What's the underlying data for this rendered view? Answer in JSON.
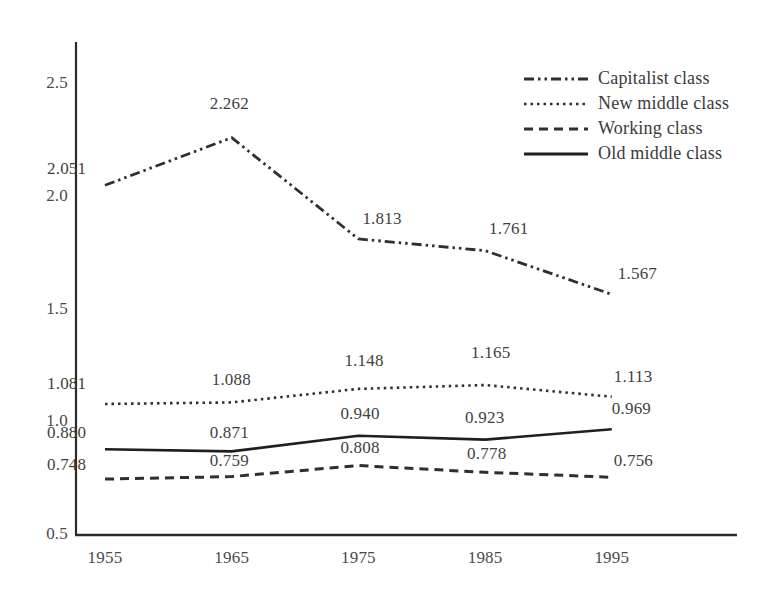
{
  "chart_data": {
    "type": "line",
    "title": "",
    "subtitle": "",
    "xlabel": "",
    "ylabel": "",
    "categories": [
      "1955",
      "1965",
      "1975",
      "1985",
      "1995"
    ],
    "x": [
      1955,
      1965,
      1975,
      1985,
      1995
    ],
    "xlim": [
      1955,
      2005
    ],
    "ylim": [
      0.5,
      2.5
    ],
    "y_ticks": [
      "0.5",
      "1.0",
      "1.5",
      "2.0",
      "2.5"
    ],
    "x_ticks": [
      "1955",
      "1965",
      "1975",
      "1985",
      "1995"
    ],
    "grid": false,
    "legend_position": "top-right",
    "series": [
      {
        "name": "Capitalist class",
        "style": "dash-dot",
        "color": "#2f2f2f",
        "values": [
          2.051,
          2.262,
          1.813,
          1.761,
          1.567
        ],
        "labels": [
          "2.051",
          "2.262",
          "1.813",
          "1.761",
          "1.567"
        ]
      },
      {
        "name": "New middle class",
        "style": "dotted",
        "color": "#2f2f2f",
        "values": [
          1.081,
          1.088,
          1.148,
          1.165,
          1.113
        ],
        "labels": [
          "1.081",
          "1.088",
          "1.148",
          "1.165",
          "1.113"
        ]
      },
      {
        "name": "Working class",
        "style": "dashed",
        "color": "#2f2f2f",
        "values": [
          0.748,
          0.759,
          0.808,
          0.778,
          0.756
        ],
        "labels": [
          "0.748",
          "0.759",
          "0.808",
          "0.778",
          "0.756"
        ]
      },
      {
        "name": "Old middle class",
        "style": "solid",
        "color": "#1f1f1f",
        "values": [
          0.88,
          0.871,
          0.94,
          0.923,
          0.969
        ],
        "labels": [
          "0.880",
          "0.871",
          "0.940",
          "0.923",
          "0.969"
        ]
      }
    ]
  },
  "axes": {
    "y_ticks": [
      {
        "label": "2.5",
        "value": 2.5
      },
      {
        "label": "2.0",
        "value": 2.0
      },
      {
        "label": "1.5",
        "value": 1.5
      },
      {
        "label": "1.0",
        "value": 1.0
      },
      {
        "label": "0.5",
        "value": 0.5
      }
    ],
    "x_ticks": [
      {
        "label": "1955",
        "value": 1955
      },
      {
        "label": "1965",
        "value": 1965
      },
      {
        "label": "1975",
        "value": 1975
      },
      {
        "label": "1985",
        "value": 1985
      },
      {
        "label": "1995",
        "value": 1995
      }
    ],
    "axis_color": "#2a2a2a"
  },
  "legend": {
    "items": [
      {
        "label": "Capitalist class",
        "style": "dash-dot"
      },
      {
        "label": "New middle class",
        "style": "dotted"
      },
      {
        "label": "Working class",
        "style": "dashed"
      },
      {
        "label": "Old middle class",
        "style": "solid"
      }
    ]
  },
  "point_labels": [
    {
      "text": "2.051",
      "series": "Capitalist class",
      "x": 1955
    },
    {
      "text": "2.262",
      "series": "Capitalist class",
      "x": 1965
    },
    {
      "text": "1.813",
      "series": "Capitalist class",
      "x": 1975
    },
    {
      "text": "1.761",
      "series": "Capitalist class",
      "x": 1985
    },
    {
      "text": "1.567",
      "series": "Capitalist class",
      "x": 1995
    },
    {
      "text": "1.081",
      "series": "New middle class",
      "x": 1955
    },
    {
      "text": "1.088",
      "series": "New middle class",
      "x": 1965
    },
    {
      "text": "1.148",
      "series": "New middle class",
      "x": 1975
    },
    {
      "text": "1.165",
      "series": "New middle class",
      "x": 1985
    },
    {
      "text": "1.113",
      "series": "New middle class",
      "x": 1995
    },
    {
      "text": "0.880",
      "series": "Old middle class",
      "x": 1955
    },
    {
      "text": "0.871",
      "series": "Old middle class",
      "x": 1965
    },
    {
      "text": "0.940",
      "series": "Old middle class",
      "x": 1975
    },
    {
      "text": "0.923",
      "series": "Old middle class",
      "x": 1985
    },
    {
      "text": "0.969",
      "series": "Old middle class",
      "x": 1995
    },
    {
      "text": "0.748",
      "series": "Working class",
      "x": 1955
    },
    {
      "text": "0.759",
      "series": "Working class",
      "x": 1965
    },
    {
      "text": "0.808",
      "series": "Working class",
      "x": 1975
    },
    {
      "text": "0.778",
      "series": "Working class",
      "x": 1985
    },
    {
      "text": "0.756",
      "series": "Working class",
      "x": 1995
    }
  ]
}
